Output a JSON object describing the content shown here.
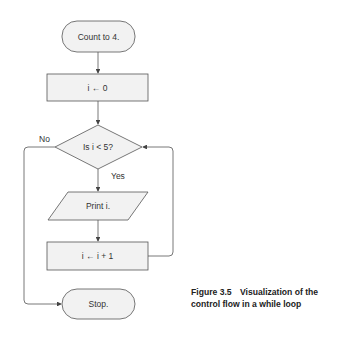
{
  "flowchart": {
    "start": {
      "label": "Count to 4."
    },
    "init": {
      "label": "i ← 0"
    },
    "decision": {
      "label": "Is i < 5?",
      "yes_label": "Yes",
      "no_label": "No"
    },
    "output": {
      "label": "Print i."
    },
    "increment": {
      "label": "i ← i + 1"
    },
    "end": {
      "label": "Stop."
    }
  },
  "caption": {
    "number": "Figure 3.5",
    "text": "Visualization of the control flow in a while loop"
  },
  "colors": {
    "shape_fill": "#f2f2f2",
    "stroke": "#555555",
    "text": "#333333"
  }
}
